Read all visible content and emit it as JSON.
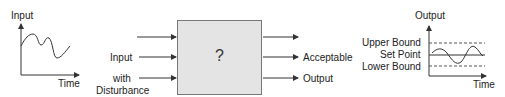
{
  "left_graph": {
    "y_label": "Input",
    "x_label": "Time"
  },
  "inputs": [
    {
      "label": ""
    },
    {
      "label": "Input"
    },
    {
      "label": "with Disturbance",
      "line1": "with",
      "line2": "Disturbance"
    }
  ],
  "system_box": {
    "symbol": "?",
    "fill": "#e4e4e4"
  },
  "outputs": [
    {
      "label": ""
    },
    {
      "label": "Acceptable"
    },
    {
      "label": "Output"
    }
  ],
  "right_graph": {
    "y_label": "Output",
    "x_label": "Time",
    "upper_bound": "Upper Bound",
    "set_point": "Set Point",
    "lower_bound": "Lower Bound"
  }
}
